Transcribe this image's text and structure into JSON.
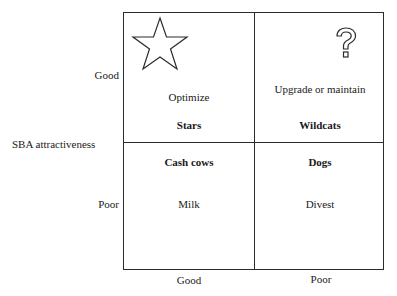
{
  "diagram": {
    "type": "2x2 portfolio matrix",
    "y_axis": {
      "title": "SBA attractiveness",
      "ticks": [
        "Good",
        "Poor"
      ]
    },
    "x_axis": {
      "ticks": [
        "Good",
        "Poor"
      ]
    },
    "quadrants": {
      "top_left": {
        "name": "Stars",
        "strategy": "Optimize",
        "icon": "star-icon"
      },
      "top_right": {
        "name": "Wildcats",
        "strategy": "Upgrade or maintain",
        "icon": "question-mark-icon"
      },
      "bottom_left": {
        "name": "Cash cows",
        "strategy": "Milk"
      },
      "bottom_right": {
        "name": "Dogs",
        "strategy": "Divest"
      }
    },
    "colors": {
      "line": "#2b2b2b",
      "text": "#1a1a1a",
      "background": "#ffffff"
    }
  }
}
